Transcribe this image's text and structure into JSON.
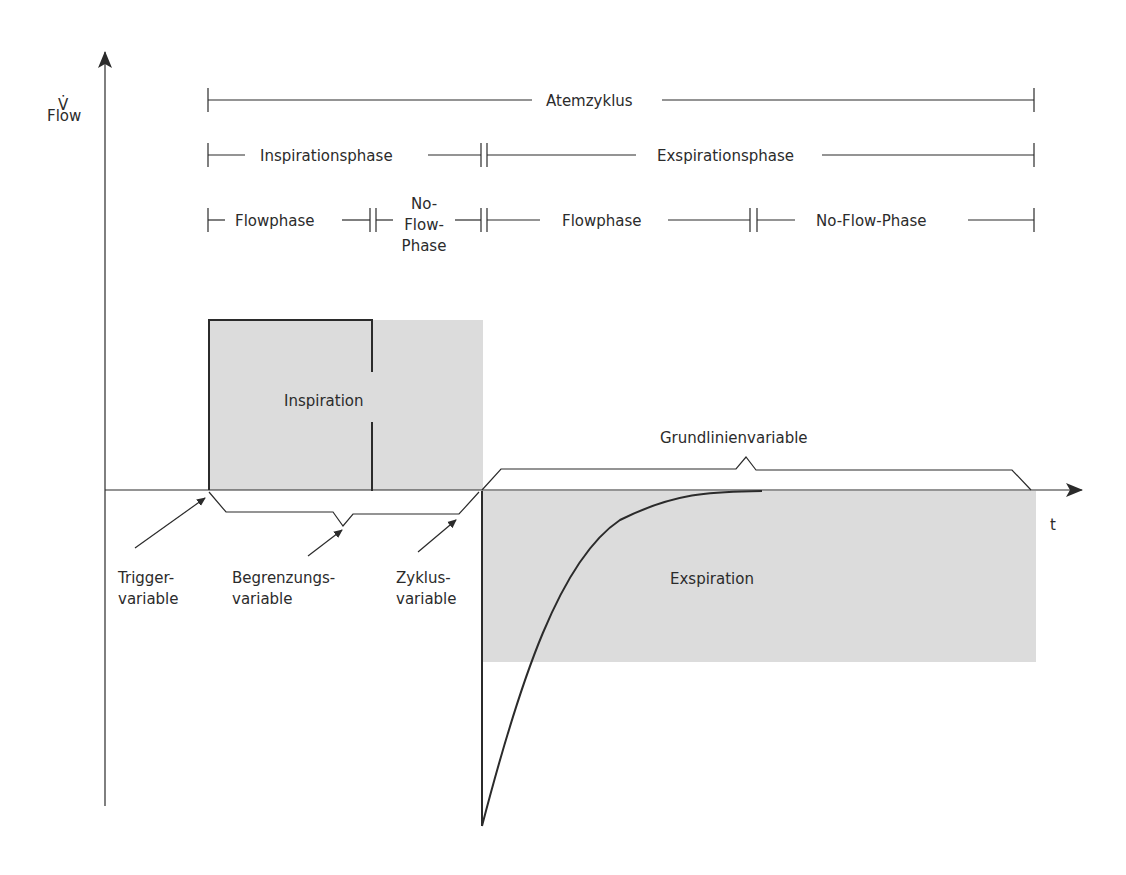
{
  "diagram": {
    "type": "ventilation-flow-curve",
    "colors": {
      "shade": "#dcdcdc",
      "line": "#2b2b2b",
      "background": "#ffffff"
    },
    "y_axis": {
      "symbol": "V̇",
      "label": "Flow"
    },
    "x_axis": {
      "label": "t"
    },
    "phases": {
      "row1": {
        "label": "Atemzyklus"
      },
      "row2": [
        {
          "label": "Inspirationsphase"
        },
        {
          "label": "Exspirationsphase"
        }
      ],
      "row3": [
        {
          "label": "Flowphase"
        },
        {
          "label_lines": [
            "No-",
            "Flow-",
            "Phase"
          ]
        },
        {
          "label": "Flowphase"
        },
        {
          "label": "No-Flow-Phase"
        }
      ]
    },
    "regions": {
      "inspiration": {
        "label": "Inspiration"
      },
      "expiration": {
        "label": "Exspiration"
      }
    },
    "annotations": {
      "baseline": {
        "label": "Grundlinienvariable"
      },
      "trigger": {
        "line1": "Trigger-",
        "line2": "variable"
      },
      "limit": {
        "line1": "Begrenzungs-",
        "line2": "variable"
      },
      "cycle": {
        "line1": "Zyklus-",
        "line2": "variable"
      }
    }
  }
}
